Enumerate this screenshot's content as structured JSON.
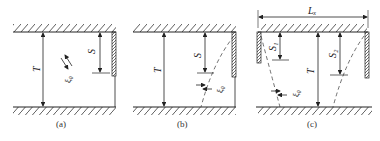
{
  "figure": {
    "panels": [
      {
        "id": "a",
        "caption": "(a)",
        "labels": {
          "T": "T",
          "S": "S",
          "xi": "ξ₀"
        }
      },
      {
        "id": "b",
        "caption": "(b)",
        "labels": {
          "T": "T",
          "S": "S",
          "xi": "ξ₀"
        }
      },
      {
        "id": "c",
        "caption": "(c)",
        "labels": {
          "Lx": "Lₓ",
          "S1": "S₁",
          "S2": "S₂",
          "T": "T",
          "xi": "ξ₀"
        }
      }
    ],
    "colors": {
      "line": "#222222",
      "background": "#ffffff"
    }
  }
}
